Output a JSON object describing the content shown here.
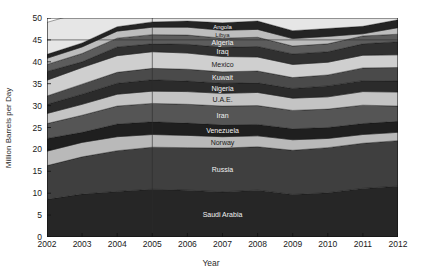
{
  "chart_data": {
    "type": "area",
    "title": "",
    "xlabel": "Year",
    "ylabel": "Million Barrels per Day",
    "x": [
      2002,
      2003,
      2004,
      2005,
      2006,
      2007,
      2008,
      2009,
      2010,
      2011,
      2012
    ],
    "xlim": [
      2002,
      2012
    ],
    "ylim": [
      0,
      50
    ],
    "yticks": [
      0,
      5,
      10,
      15,
      20,
      25,
      30,
      35,
      40,
      45,
      50
    ],
    "xticks": [
      "2002",
      "2003",
      "2004",
      "2005",
      "2006",
      "2007",
      "2008",
      "2009",
      "2010",
      "2011",
      "2012"
    ],
    "grid": "horizontal-line-at-45-and-vertical-line-at-2005",
    "stacked": true,
    "legend": "inline-band-labels",
    "series": [
      {
        "name": "Saudi Arabia",
        "color": "#262626",
        "label_fill": "light",
        "values": [
          8.6,
          9.8,
          10.4,
          10.9,
          10.7,
          10.3,
          10.7,
          9.7,
          10.1,
          11.1,
          11.6
        ]
      },
      {
        "name": "Russia",
        "color": "#3f3f3f",
        "label_fill": "light",
        "values": [
          7.7,
          8.5,
          9.3,
          9.6,
          9.7,
          10.0,
          9.9,
          10.1,
          10.3,
          10.3,
          10.4
        ]
      },
      {
        "name": "Norway",
        "color": "#b9b9b9",
        "label_fill": "dark",
        "values": [
          3.3,
          3.3,
          3.2,
          2.9,
          2.8,
          2.6,
          2.5,
          2.4,
          2.1,
          2.0,
          1.9
        ]
      },
      {
        "name": "Venezuela",
        "color": "#1f1f1f",
        "label_fill": "light",
        "values": [
          2.9,
          2.3,
          2.9,
          2.9,
          2.8,
          2.7,
          2.6,
          2.5,
          2.5,
          2.5,
          2.5
        ]
      },
      {
        "name": "Iran",
        "color": "#555555",
        "label_fill": "light",
        "values": [
          3.4,
          3.9,
          4.1,
          4.2,
          4.3,
          4.3,
          4.3,
          4.2,
          4.2,
          4.2,
          3.5
        ]
      },
      {
        "name": "U.A.E.",
        "color": "#c4c4c4",
        "label_fill": "dark",
        "values": [
          2.3,
          2.5,
          2.7,
          2.8,
          2.9,
          2.9,
          3.0,
          2.8,
          2.8,
          3.1,
          3.2
        ]
      },
      {
        "name": "Nigeria",
        "color": "#2b2b2b",
        "label_fill": "light",
        "values": [
          2.1,
          2.3,
          2.5,
          2.6,
          2.4,
          2.3,
          2.2,
          2.2,
          2.5,
          2.5,
          2.5
        ]
      },
      {
        "name": "Kuwait",
        "color": "#4a4a4a",
        "label_fill": "light",
        "values": [
          1.9,
          2.3,
          2.5,
          2.6,
          2.7,
          2.6,
          2.7,
          2.5,
          2.5,
          2.9,
          3.1
        ]
      },
      {
        "name": "Mexico",
        "color": "#cfcfcf",
        "label_fill": "dark",
        "values": [
          3.6,
          3.8,
          3.8,
          3.8,
          3.7,
          3.5,
          3.2,
          3.0,
          2.9,
          2.9,
          2.9
        ]
      },
      {
        "name": "Iraq",
        "color": "#303030",
        "label_fill": "light",
        "values": [
          2.0,
          1.3,
          2.0,
          1.8,
          2.0,
          2.1,
          2.4,
          2.4,
          2.4,
          2.6,
          3.0
        ]
      },
      {
        "name": "Algeria",
        "color": "#5c5c5c",
        "label_fill": "light",
        "values": [
          1.6,
          1.9,
          2.0,
          2.1,
          2.1,
          2.1,
          2.1,
          1.8,
          1.8,
          1.8,
          1.7
        ]
      },
      {
        "name": "Libya",
        "color": "#bdbdbd",
        "label_fill": "dark",
        "values": [
          1.4,
          1.5,
          1.6,
          1.7,
          1.8,
          1.8,
          1.8,
          1.7,
          1.7,
          0.5,
          1.5
        ]
      },
      {
        "name": "Angola",
        "color": "#242424",
        "label_fill": "light",
        "values": [
          0.9,
          0.9,
          1.0,
          1.2,
          1.4,
          1.7,
          1.9,
          1.8,
          1.8,
          1.7,
          1.8
        ]
      },
      {
        "name": "Other",
        "color": "#e6e6e6",
        "label_fill": "dark",
        "values": [
          7.3,
          7.0,
          7.2,
          7.4,
          7.0,
          6.8,
          6.8,
          6.5,
          6.5,
          6.2,
          6.3
        ]
      }
    ]
  },
  "axes": {
    "y_title": "Million Barrels per Day",
    "x_title": "Year"
  }
}
